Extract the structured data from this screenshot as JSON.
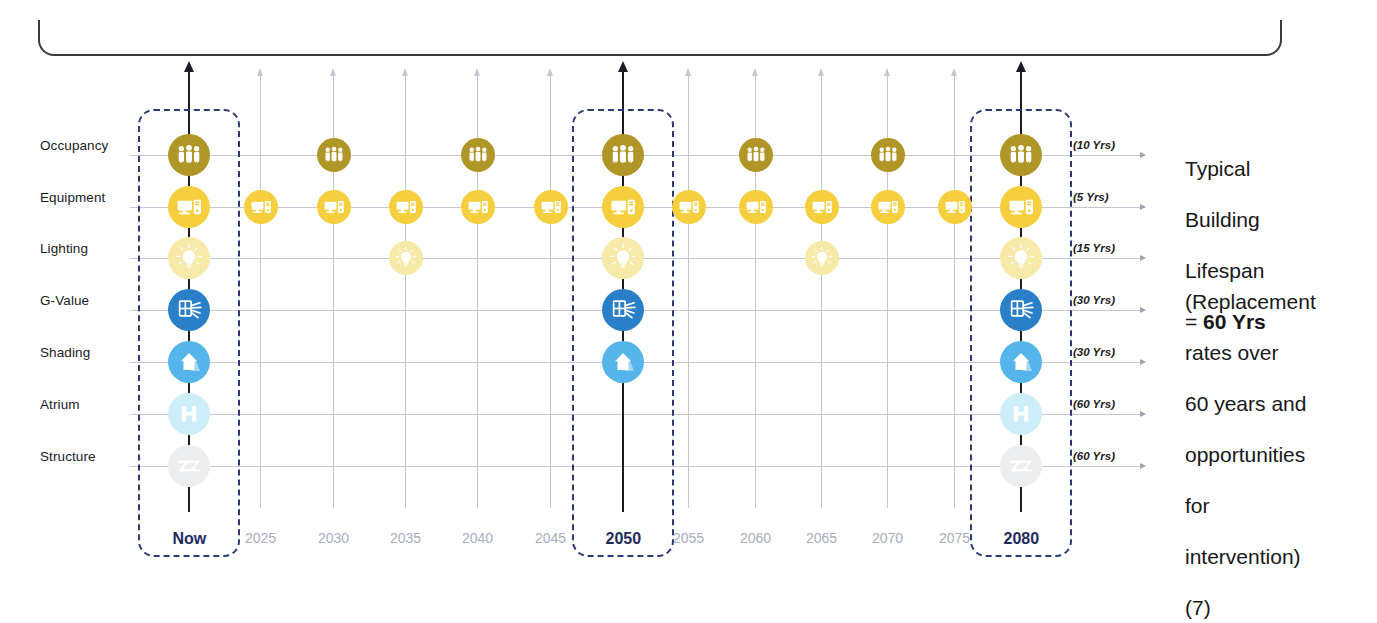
{
  "figure": {
    "title_fragment": "",
    "bracket": {
      "label": ""
    }
  },
  "rows": [
    {
      "key": "occupancy",
      "label": "Occupancy",
      "years_label": "(10 Yrs)",
      "interval_years": 10,
      "color": "#b09527",
      "icon": "occupancy-people-icon"
    },
    {
      "key": "equipment",
      "label": "Equipment",
      "years_label": "(5 Yrs)",
      "interval_years": 5,
      "color": "#f5cf3d",
      "icon": "equipment-computer-icon"
    },
    {
      "key": "lighting",
      "label": "Lighting",
      "years_label": "(15 Yrs)",
      "interval_years": 15,
      "color": "#f7e9a8",
      "icon": "lighting-bulb-icon"
    },
    {
      "key": "gvalue",
      "label": "G-Value",
      "years_label": "(30 Yrs)",
      "interval_years": 30,
      "color": "#2a7fc9",
      "icon": "g-value-window-icon"
    },
    {
      "key": "shading",
      "label": "Shading",
      "years_label": "(30 Yrs)",
      "interval_years": 30,
      "color": "#55b4ea",
      "icon": "shading-house-icon"
    },
    {
      "key": "atrium",
      "label": "Atrium",
      "years_label": "(60 Yrs)",
      "interval_years": 60,
      "color": "#cdeef8",
      "icon": "atrium-icon"
    },
    {
      "key": "structure",
      "label": "Structure",
      "years_label": "(60 Yrs)",
      "interval_years": 60,
      "color": "#eceef0",
      "icon": "structure-icon"
    }
  ],
  "columns": [
    {
      "label": "Now",
      "emphasis": "major",
      "highlighted": true,
      "markers": [
        "occupancy",
        "equipment",
        "lighting",
        "gvalue",
        "shading",
        "atrium",
        "structure"
      ]
    },
    {
      "label": "2025",
      "emphasis": "minor",
      "highlighted": false,
      "markers": [
        "equipment"
      ]
    },
    {
      "label": "2030",
      "emphasis": "minor",
      "highlighted": false,
      "markers": [
        "occupancy",
        "equipment"
      ]
    },
    {
      "label": "2035",
      "emphasis": "minor",
      "highlighted": false,
      "markers": [
        "equipment",
        "lighting"
      ]
    },
    {
      "label": "2040",
      "emphasis": "minor",
      "highlighted": false,
      "markers": [
        "occupancy",
        "equipment"
      ]
    },
    {
      "label": "2045",
      "emphasis": "minor",
      "highlighted": false,
      "markers": [
        "equipment"
      ]
    },
    {
      "label": "2050",
      "emphasis": "major",
      "highlighted": true,
      "markers": [
        "occupancy",
        "equipment",
        "lighting",
        "gvalue",
        "shading"
      ]
    },
    {
      "label": "2055",
      "emphasis": "minor",
      "highlighted": false,
      "markers": [
        "equipment"
      ]
    },
    {
      "label": "2060",
      "emphasis": "minor",
      "highlighted": false,
      "markers": [
        "occupancy",
        "equipment"
      ]
    },
    {
      "label": "2065",
      "emphasis": "minor",
      "highlighted": false,
      "markers": [
        "equipment",
        "lighting"
      ]
    },
    {
      "label": "2070",
      "emphasis": "minor",
      "highlighted": false,
      "markers": [
        "occupancy",
        "equipment"
      ]
    },
    {
      "label": "2075",
      "emphasis": "minor",
      "highlighted": false,
      "markers": [
        "equipment"
      ]
    },
    {
      "label": "2080",
      "emphasis": "major",
      "highlighted": true,
      "markers": [
        "occupancy",
        "equipment",
        "lighting",
        "gvalue",
        "shading",
        "atrium",
        "structure"
      ]
    }
  ],
  "annotations": {
    "lifespan_line1": "Typical",
    "lifespan_line2": "Building",
    "lifespan_line3": "Lifespan",
    "lifespan_line4_prefix": "= ",
    "lifespan_line4_value": "60 Yrs",
    "note_line1": "(Replacement",
    "note_line2": "rates over",
    "note_line3": "60 years and",
    "note_line4": "opportunities",
    "note_line5": "for",
    "note_line6": "intervention)",
    "note_line7": "(7)"
  },
  "colors": {
    "accent_dark_blue": "#1f2a5c",
    "grid": "#b9bfcb",
    "minor_axis": "#c2c7d2",
    "major_axis": "#1b1b24"
  },
  "chart_data": {
    "type": "timeline",
    "xlabel": "Year",
    "ylabel": "Building component",
    "categories": [
      "Now",
      "2025",
      "2030",
      "2035",
      "2040",
      "2045",
      "2050",
      "2055",
      "2060",
      "2065",
      "2070",
      "2075",
      "2080"
    ],
    "components": [
      "Occupancy",
      "Equipment",
      "Lighting",
      "G-Value",
      "Shading",
      "Atrium",
      "Structure"
    ],
    "replacement_interval_years": {
      "Occupancy": 10,
      "Equipment": 5,
      "Lighting": 15,
      "G-Value": 30,
      "Shading": 30,
      "Atrium": 60,
      "Structure": 60
    },
    "events": {
      "Occupancy": [
        "Now",
        "2030",
        "2040",
        "2050",
        "2060",
        "2070",
        "2080"
      ],
      "Equipment": [
        "Now",
        "2025",
        "2030",
        "2035",
        "2040",
        "2045",
        "2050",
        "2055",
        "2060",
        "2065",
        "2070",
        "2075",
        "2080"
      ],
      "Lighting": [
        "Now",
        "2035",
        "2050",
        "2065",
        "2080"
      ],
      "G-Value": [
        "Now",
        "2050",
        "2080"
      ],
      "Shading": [
        "Now",
        "2050",
        "2080"
      ],
      "Atrium": [
        "Now",
        "2080"
      ],
      "Structure": [
        "Now",
        "2080"
      ]
    },
    "legend": "none",
    "grid": true
  }
}
